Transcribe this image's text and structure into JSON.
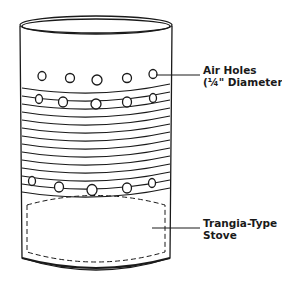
{
  "diagram": {
    "labels": [
      {
        "id": "air-holes",
        "line1": "Air Holes",
        "line2": "(¼\" Diameter)"
      },
      {
        "id": "stove",
        "line1": "Trangia-Type",
        "line2": "Stove"
      }
    ],
    "colors": {
      "stroke": "#1a1a1a",
      "background": "#ffffff"
    }
  }
}
